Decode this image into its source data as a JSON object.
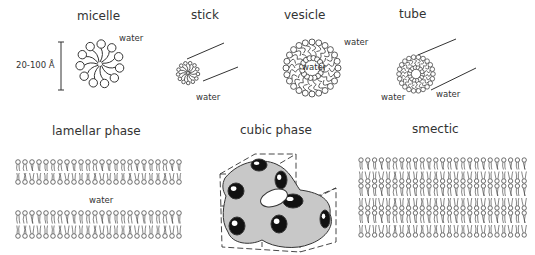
{
  "titles": {
    "micelle": "micelle",
    "stick": "stick",
    "vesicle": "vesicle",
    "tube": "tube",
    "lamellar": "lamellar phase",
    "cubic": "cubic phase",
    "smectic": "smectic"
  },
  "annotations": {
    "micelle_water": "water",
    "micelle_size": "20-100 Å",
    "stick_water": "water",
    "vesicle_water_outside": "water",
    "vesicle_water_inside": "water",
    "tube_water_inside": "water",
    "tube_water_outside": "water",
    "lamellar_water": "water"
  },
  "colors": {
    "line": "#333333",
    "cubic_fill": "#c8c8c8",
    "cubic_hole": "#111111"
  }
}
